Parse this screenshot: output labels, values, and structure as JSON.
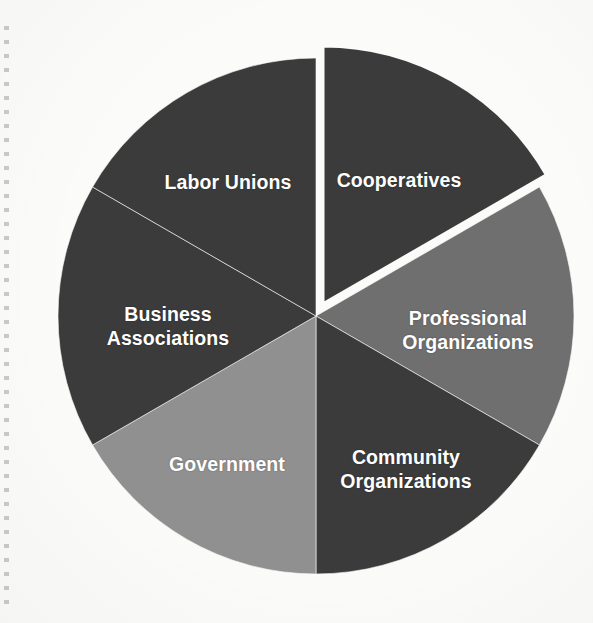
{
  "chart_data": {
    "type": "pie",
    "title": "",
    "subtitle": "",
    "xlabel": "",
    "ylabel": "",
    "legend": "none (labels drawn inside slices)",
    "grid": false,
    "start_angle_deg": 0,
    "direction": "clockwise",
    "categories": [
      "Cooperatives",
      "Professional Organizations",
      "Community Organizations",
      "Government",
      "Business Associations",
      "Labor Unions"
    ],
    "values": [
      16.67,
      16.67,
      16.67,
      16.67,
      16.67,
      16.67
    ],
    "slices": [
      {
        "label": "Cooperatives",
        "label_lines": "Cooperatives",
        "value": 16.67,
        "start_deg": 0,
        "end_deg": 60,
        "color": "#3b3b3b",
        "exploded": true,
        "label_x": 399,
        "label_y": 181
      },
      {
        "label": "Professional Organizations",
        "label_lines": "Professional\nOrganizations",
        "value": 16.67,
        "start_deg": 60,
        "end_deg": 120,
        "color": "#6f6f6f",
        "exploded": false,
        "label_x": 468,
        "label_y": 331
      },
      {
        "label": "Community Organizations",
        "label_lines": "Community\nOrganizations",
        "value": 16.67,
        "start_deg": 120,
        "end_deg": 180,
        "color": "#3b3b3b",
        "exploded": false,
        "label_x": 406,
        "label_y": 470
      },
      {
        "label": "Government",
        "label_lines": "Government",
        "value": 16.67,
        "start_deg": 180,
        "end_deg": 240,
        "color": "#909090",
        "exploded": false,
        "label_x": 227,
        "label_y": 465
      },
      {
        "label": "Business Associations",
        "label_lines": "Business\nAssociations",
        "value": 16.67,
        "start_deg": 240,
        "end_deg": 300,
        "color": "#3b3b3b",
        "exploded": false,
        "label_x": 168,
        "label_y": 327
      },
      {
        "label": "Labor Unions",
        "label_lines": "Labor Unions",
        "value": 16.67,
        "start_deg": 300,
        "end_deg": 360,
        "color": "#3b3b3b",
        "exploded": false,
        "label_x": 228,
        "label_y": 183
      }
    ],
    "geometry": {
      "center_x": 316,
      "center_y": 316,
      "radius": 258,
      "explode_offset": 14
    },
    "colors": {
      "dark": "#3b3b3b",
      "medium": "#6f6f6f",
      "light": "#909090",
      "background": "#fbfbfa",
      "label_text": "#ffffff",
      "separator": "#fbfbfa"
    }
  }
}
